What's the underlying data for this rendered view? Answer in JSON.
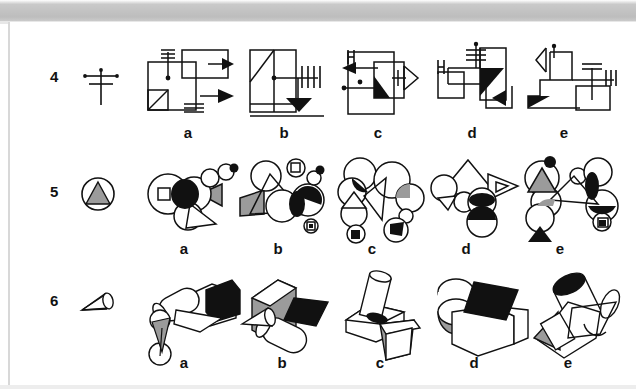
{
  "page": {
    "kind": "scanned-test-page",
    "background_color": "#ffffff",
    "ink_color": "#111111",
    "fill_black": "#000000",
    "fill_gray": "#9b9b9b",
    "scanner_band_color": "#bdbdbd"
  },
  "rows": [
    {
      "number": "4",
      "prompt_name": "cross-with-dots",
      "options": [
        {
          "label": "a",
          "name": "option-4a"
        },
        {
          "label": "b",
          "name": "option-4b"
        },
        {
          "label": "c",
          "name": "option-4c"
        },
        {
          "label": "d",
          "name": "option-4d"
        },
        {
          "label": "e",
          "name": "option-4e"
        }
      ]
    },
    {
      "number": "5",
      "prompt_name": "circle-with-gray-triangle",
      "options": [
        {
          "label": "a",
          "name": "option-5a"
        },
        {
          "label": "b",
          "name": "option-5b"
        },
        {
          "label": "c",
          "name": "option-5c"
        },
        {
          "label": "d",
          "name": "option-5d"
        },
        {
          "label": "e",
          "name": "option-5e"
        }
      ]
    },
    {
      "number": "6",
      "prompt_name": "cone-3d",
      "options": [
        {
          "label": "a",
          "name": "option-6a"
        },
        {
          "label": "b",
          "name": "option-6b"
        },
        {
          "label": "c",
          "name": "option-6c"
        },
        {
          "label": "d",
          "name": "option-6d"
        },
        {
          "label": "e",
          "name": "option-6e"
        }
      ]
    }
  ]
}
